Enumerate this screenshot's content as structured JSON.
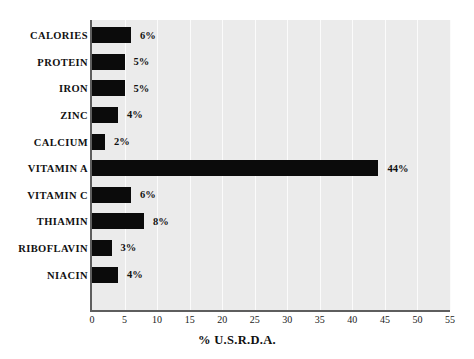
{
  "chart_data": {
    "type": "bar",
    "orientation": "horizontal",
    "title": "",
    "xlabel": "% U.S.R.D.A.",
    "ylabel": "",
    "xlim": [
      0,
      55
    ],
    "xticks": [
      0,
      5,
      10,
      15,
      20,
      25,
      30,
      35,
      40,
      45,
      50,
      55
    ],
    "xtick_labels": [
      "0",
      "5",
      "10",
      "15",
      "20",
      "25",
      "30",
      "35",
      "40",
      "45",
      "50",
      "55"
    ],
    "grid": true,
    "grid_axis": "x",
    "legend": false,
    "categories": [
      "CALORIES",
      "PROTEIN",
      "IRON",
      "ZINC",
      "CALCIUM",
      "VITAMIN A",
      "VITAMIN C",
      "THIAMIN",
      "RIBOFLAVIN",
      "NIACIN"
    ],
    "values": [
      6,
      5,
      5,
      4,
      2,
      44,
      6,
      8,
      3,
      4
    ],
    "data_labels": [
      "6%",
      "5%",
      "5%",
      "4%",
      "2%",
      "44%",
      "6%",
      "8%",
      "3%",
      "4%"
    ],
    "bar_color": "#0b0b0b",
    "plot_background": "#ebebeb",
    "gridline_color": "#fbfbfb",
    "axis_color": "#5e5e5e",
    "figure_background": "#ffffff"
  }
}
